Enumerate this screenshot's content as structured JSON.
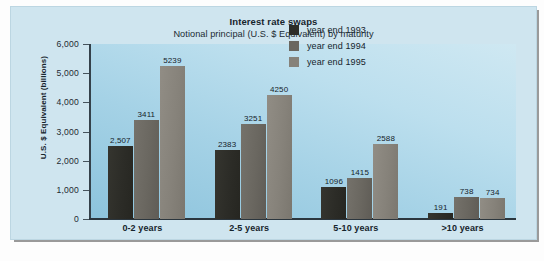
{
  "chart_data": {
    "type": "bar",
    "title": "Interest rate swaps",
    "subtitle": "Notional principal (U.S. $ Equivalent) by maturity",
    "xlabel": "",
    "ylabel": "U.S. $ Equivalent (billions)",
    "ylim": [
      0,
      6000
    ],
    "ytick_values": [
      0,
      1000,
      2000,
      3000,
      4000,
      5000,
      6000
    ],
    "ytick_labels": [
      "0",
      "1,000",
      "2,000",
      "3,000",
      "4,000",
      "5,000",
      "6,000"
    ],
    "grid": false,
    "legend_position": "top-right",
    "categories": [
      "0-2 years",
      "2-5 years",
      "5-10 years",
      ">10 years"
    ],
    "series": [
      {
        "name": "year end 1993",
        "color": "#2c2c27",
        "values": [
          2507,
          2383,
          1096,
          191
        ],
        "value_labels": [
          "2,507",
          "2383",
          "1096",
          "191"
        ]
      },
      {
        "name": "year end 1994",
        "color": "#6a6760",
        "values": [
          3411,
          3251,
          1415,
          738
        ],
        "value_labels": [
          "3411",
          "3251",
          "1415",
          "738"
        ]
      },
      {
        "name": "year end 1995",
        "color": "#86827a",
        "values": [
          5239,
          4250,
          2588,
          734
        ],
        "value_labels": [
          "5239",
          "4250",
          "2588",
          "734"
        ]
      }
    ]
  },
  "caption": {
    "text": ""
  }
}
